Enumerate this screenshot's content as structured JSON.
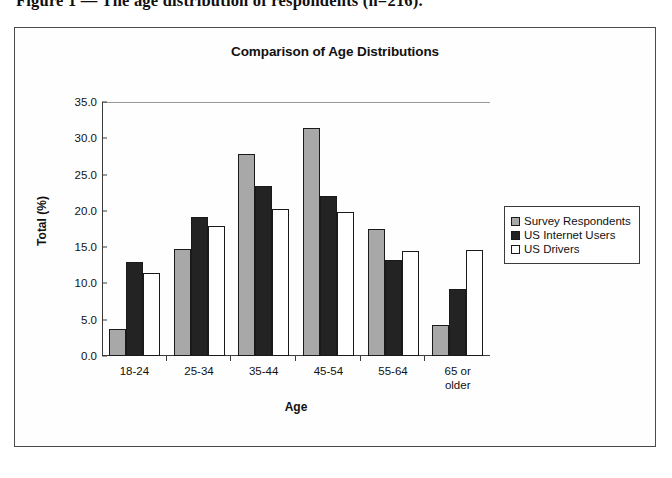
{
  "figure": {
    "caption": "Figure 1 — The age distribution of respondents (n=216)."
  },
  "chart_data": {
    "type": "bar",
    "title": "Comparison of Age Distributions",
    "xlabel": "Age",
    "ylabel": "Total (%)",
    "ylim": [
      0.0,
      35.0
    ],
    "ytick_labels": [
      "35.0",
      "30.0",
      "25.0",
      "20.0",
      "15.0",
      "10.0",
      "5.0",
      "0.0"
    ],
    "ytick_values": [
      35.0,
      30.0,
      25.0,
      20.0,
      15.0,
      10.0,
      5.0,
      0.0
    ],
    "grid": false,
    "legend_position": "right",
    "categories": [
      "18-24",
      "25-34",
      "35-44",
      "45-54",
      "55-64",
      "65 or older"
    ],
    "category_lines": [
      [
        "18-24"
      ],
      [
        "25-34"
      ],
      [
        "35-44"
      ],
      [
        "45-54"
      ],
      [
        "55-64"
      ],
      [
        "65 or",
        "older"
      ]
    ],
    "series": [
      {
        "name": "Survey Respondents",
        "color": "#a8a8a8",
        "values": [
          3.7,
          14.7,
          27.9,
          31.4,
          17.5,
          4.3
        ]
      },
      {
        "name": "US Internet Users",
        "color": "#232323",
        "values": [
          13.0,
          19.1,
          23.4,
          22.0,
          13.2,
          9.3
        ]
      },
      {
        "name": "US Drivers",
        "color": "#ffffff",
        "values": [
          11.4,
          17.9,
          20.2,
          19.9,
          14.5,
          14.6
        ]
      }
    ]
  }
}
